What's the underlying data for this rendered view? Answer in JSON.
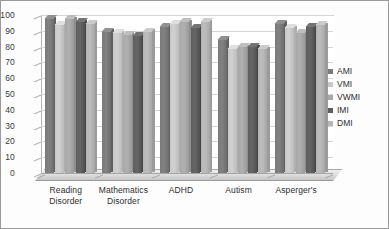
{
  "chart_data": {
    "type": "bar",
    "title": "",
    "subtitle": "",
    "xlabel": "",
    "ylabel": "",
    "ylim": [
      0,
      100
    ],
    "ytick_step": 10,
    "yticks": [
      100,
      90,
      80,
      70,
      60,
      50,
      40,
      30,
      20,
      10,
      0
    ],
    "grid": true,
    "legend_position": "right",
    "style": "3d-clustered-column-grayscale",
    "categories": [
      "Reading Disorder",
      "Mathematics Disorder",
      "ADHD",
      "Autism",
      "Asperger's"
    ],
    "category_lines": [
      [
        "Reading",
        "Disorder"
      ],
      [
        "Mathematics",
        "Disorder"
      ],
      [
        "ADHD",
        ""
      ],
      [
        "Autism",
        ""
      ],
      [
        "Asperger's",
        ""
      ]
    ],
    "series": [
      {
        "name": "AMI",
        "color": "#7a7a7a",
        "values": [
          100,
          92,
          95,
          87,
          97
        ]
      },
      {
        "name": "VMI",
        "color": "#c9c9c9",
        "values": [
          96,
          91,
          97,
          81,
          94
        ]
      },
      {
        "name": "VWMI",
        "color": "#a8a8a8",
        "values": [
          100,
          90,
          98,
          82,
          91
        ]
      },
      {
        "name": "IMI",
        "color": "#5e5e5e",
        "values": [
          98,
          89,
          94,
          82,
          95
        ]
      },
      {
        "name": "DMI",
        "color": "#b5b5b5",
        "values": [
          97,
          92,
          98,
          81,
          96
        ]
      }
    ]
  },
  "colors": {
    "plot_background": "#ffffff",
    "frame_border": "#9a9a9a",
    "gridline": "#d5d5d5",
    "axis": "#a9a9a9",
    "text": "#2d2d2d"
  }
}
